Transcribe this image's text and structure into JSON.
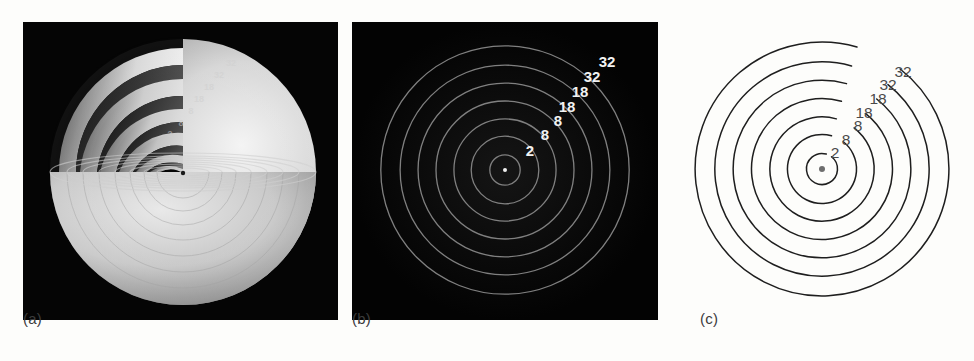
{
  "figure": {
    "background_color": "#fdfdfb",
    "panel_count": 3
  },
  "chart_data": {
    "type": "scatter",
    "title": "",
    "subtitle": "",
    "xlabel": "",
    "ylabel": "",
    "grid": false,
    "legend_position": "none",
    "categories": [
      "K",
      "L",
      "M",
      "N",
      "O",
      "P",
      "Q"
    ],
    "labels": [
      "2",
      "8",
      "8",
      "18",
      "18",
      "32",
      "32"
    ],
    "values": [
      2,
      8,
      8,
      18,
      18,
      32,
      32
    ],
    "shells": [
      {
        "index": 1,
        "label": "2",
        "capacity": 2,
        "radius_rel": 0.11
      },
      {
        "index": 2,
        "label": "8",
        "capacity": 8,
        "radius_rel": 0.245
      },
      {
        "index": 3,
        "label": "8",
        "capacity": 8,
        "radius_rel": 0.37
      },
      {
        "index": 4,
        "label": "18",
        "capacity": 18,
        "radius_rel": 0.5
      },
      {
        "index": 5,
        "label": "18",
        "capacity": 18,
        "radius_rel": 0.63
      },
      {
        "index": 6,
        "label": "32",
        "capacity": 32,
        "radius_rel": 0.76
      },
      {
        "index": 7,
        "label": "32",
        "capacity": 32,
        "radius_rel": 0.9
      }
    ],
    "nucleus": {
      "label": "",
      "shown": true
    }
  },
  "panels": [
    {
      "id": "a",
      "caption": "(a)",
      "kind": "rendered-3d-cutaway-sphere",
      "background_color": "#050505",
      "shell_labels": [
        "2",
        "8",
        "8",
        "18",
        "18",
        "32",
        "32"
      ]
    },
    {
      "id": "b",
      "caption": "(b)",
      "kind": "concentric-rings-dark",
      "background_color": "#040404",
      "ring_color": "#7a7a7a",
      "label_color": "#f2f2f2",
      "shell_labels": [
        "2",
        "8",
        "8",
        "18",
        "18",
        "32",
        "32"
      ]
    },
    {
      "id": "c",
      "caption": "(c)",
      "kind": "concentric-rings-lineart",
      "background_color": "#fdfdfb",
      "ring_color": "#1e1e1e",
      "label_color": "#4a4a4a",
      "shell_labels": [
        "2",
        "8",
        "8",
        "18",
        "18",
        "32",
        "32"
      ]
    }
  ],
  "labels_b": [
    {
      "text": "2",
      "x": 178,
      "y": 134
    },
    {
      "text": "8",
      "x": 193,
      "y": 118
    },
    {
      "text": "8",
      "x": 206,
      "y": 104
    },
    {
      "text": "18",
      "x": 215,
      "y": 90
    },
    {
      "text": "18",
      "x": 228,
      "y": 75
    },
    {
      "text": "32",
      "x": 240,
      "y": 60
    },
    {
      "text": "32",
      "x": 255,
      "y": 45
    }
  ],
  "labels_c": [
    {
      "text": "2",
      "x": 147,
      "y": 136
    },
    {
      "text": "8",
      "x": 158,
      "y": 123
    },
    {
      "text": "8",
      "x": 170,
      "y": 109
    },
    {
      "text": "18",
      "x": 176,
      "y": 96
    },
    {
      "text": "18",
      "x": 190,
      "y": 82
    },
    {
      "text": "32",
      "x": 200,
      "y": 68
    },
    {
      "text": "32",
      "x": 215,
      "y": 55
    }
  ],
  "labels_a": [
    {
      "text": "2",
      "x": 147,
      "y": 115
    },
    {
      "text": "8",
      "x": 158,
      "y": 104
    },
    {
      "text": "8",
      "x": 168,
      "y": 92
    },
    {
      "text": "18",
      "x": 176,
      "y": 80
    },
    {
      "text": "18",
      "x": 186,
      "y": 68
    },
    {
      "text": "32",
      "x": 196,
      "y": 56
    },
    {
      "text": "32",
      "x": 208,
      "y": 44
    }
  ]
}
